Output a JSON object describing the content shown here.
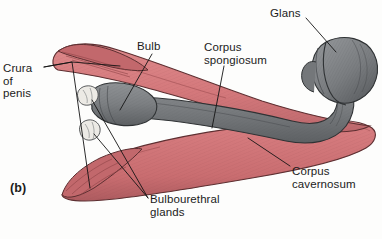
{
  "figure": {
    "panel_label": "(b)",
    "view": "oblique-lateral-cutaway"
  },
  "labels": {
    "crura_of_penis": "Crura\nof\npenis",
    "bulb": "Bulb",
    "corpus_spongiosum": "Corpus\nspongiosum",
    "glans": "Glans",
    "corpus_cavernosum": "Corpus\ncavernosum",
    "bulbourethral_glands": "Bulbourethral\nglands"
  },
  "structures": [
    {
      "name": "corpus-cavernosum-upper",
      "color": "#d4787b",
      "tone": "red"
    },
    {
      "name": "corpus-cavernosum-lower",
      "color": "#d4787b",
      "tone": "red"
    },
    {
      "name": "crus-upper",
      "color": "#c96d70",
      "tone": "red"
    },
    {
      "name": "crus-lower",
      "color": "#c96d70",
      "tone": "red"
    },
    {
      "name": "bulb-of-penis",
      "color": "#7e8083",
      "tone": "gray"
    },
    {
      "name": "corpus-spongiosum-shaft",
      "color": "#76797c",
      "tone": "gray"
    },
    {
      "name": "glans-penis",
      "color": "#7b7e81",
      "tone": "gray"
    },
    {
      "name": "bulbourethral-gland-upper",
      "color": "#e8e6e1",
      "tone": "pale"
    },
    {
      "name": "bulbourethral-gland-lower",
      "color": "#e8e6e1",
      "tone": "pale"
    }
  ],
  "colors": {
    "erectile_red": "#d4787b",
    "erectile_red_dark": "#b45f63",
    "spongy_gray": "#7e8083",
    "spongy_gray_dark": "#5a5d60",
    "gland_pale": "#e8e6e1",
    "ink": "#1b1b1b",
    "background": "#fdfdfc"
  }
}
